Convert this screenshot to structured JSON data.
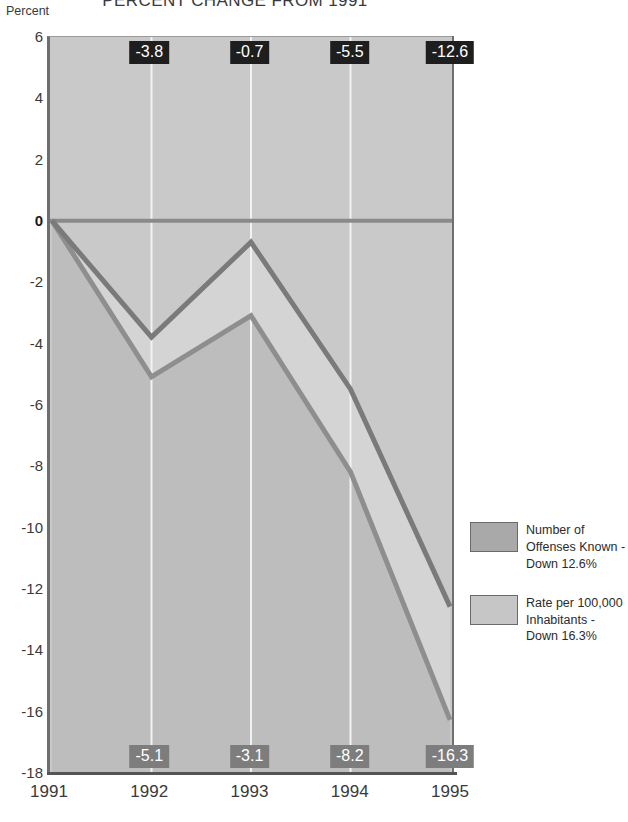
{
  "chart_data": {
    "type": "area",
    "title": "PERCENT CHANGE FROM 1991",
    "ylabel": "Percent",
    "xlabel": "",
    "categories": [
      "1991",
      "1992",
      "1993",
      "1994",
      "1995"
    ],
    "ylim": [
      -18,
      6
    ],
    "ytick_values": [
      6,
      4,
      2,
      0,
      -2,
      -4,
      -6,
      -8,
      -10,
      -12,
      -14,
      -16,
      -18
    ],
    "ytick_labels": [
      "6",
      "4",
      "2",
      "0",
      "-2",
      "-4",
      "-6",
      "-8",
      "-10",
      "-12",
      "-14",
      "-16",
      "-18"
    ],
    "grid": "vertical-white-at-1992-1993-1994",
    "legend_position": "right",
    "series": [
      {
        "name": "Number of Offenses Known - Down 12.6%",
        "color": "#9e9e9e",
        "line_color": "#7a7a7a",
        "values": [
          0,
          -3.8,
          -0.7,
          -5.5,
          -12.6
        ],
        "labels": [
          "",
          "-3.8",
          "-0.7",
          "-5.5",
          "-12.6"
        ],
        "label_style": "dark-chip-top"
      },
      {
        "name": "Rate per 100,000 Inhabitants - Down 16.3%",
        "color": "#c4c4c4",
        "line_color": "#8e8e8e",
        "values": [
          0,
          -5.1,
          -3.1,
          -8.2,
          -16.3
        ],
        "labels": [
          "",
          "-5.1",
          "-3.1",
          "-8.2",
          "-16.3"
        ],
        "label_style": "gray-chip-bottom"
      }
    ],
    "annotations": {
      "top_chips": [
        {
          "x": "1992",
          "value": "-3.8"
        },
        {
          "x": "1993",
          "value": "-0.7"
        },
        {
          "x": "1994",
          "value": "-5.5"
        },
        {
          "x": "1995",
          "value": "-12.6"
        }
      ],
      "bottom_chips": [
        {
          "x": "1992",
          "value": "-5.1"
        },
        {
          "x": "1993",
          "value": "-3.1"
        },
        {
          "x": "1994",
          "value": "-8.2"
        },
        {
          "x": "1995",
          "value": "-16.3"
        }
      ]
    }
  },
  "legend": {
    "items": [
      {
        "label": "Number of\nOffenses Known -\nDown 12.6%",
        "swatch_color": "#a9a9a9"
      },
      {
        "label": "Rate per 100,000\nInhabitants -\nDown 16.3%",
        "swatch_color": "#c6c6c6"
      }
    ]
  },
  "colors": {
    "plot_background": "#c9c9c9",
    "band_between_series": "#d4d4d4",
    "band_below_series": "#bdbdbd",
    "gridline": "#f2f2f2",
    "zero_line": "#8a8a8a",
    "axis_line": "#6e6e6e",
    "chip_dark": "#1e1e1e",
    "chip_gray": "#7d7d7d"
  }
}
